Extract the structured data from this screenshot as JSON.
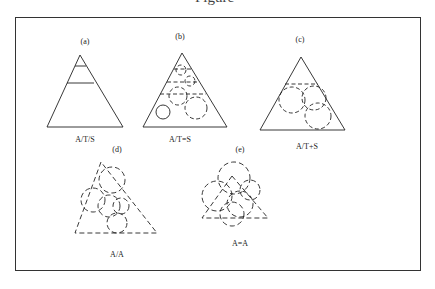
{
  "figure": {
    "title_fragment": "Figure"
  },
  "panels": [
    {
      "id": "a",
      "label": "(a)",
      "caption": "A/T/S",
      "description": "Solid triangle divided by two horizontal lines into three tiers"
    },
    {
      "id": "b",
      "label": "(b)",
      "caption": "A/T=S",
      "description": "Solid triangle with dashed tier lines and dashed circles inside"
    },
    {
      "id": "c",
      "label": "(c)",
      "caption": "A/T+S",
      "description": "Solid triangle with one dashed tier line and overlapping dashed circles extending past edge"
    },
    {
      "id": "d",
      "label": "(d)",
      "caption": "A/A",
      "description": "Dashed triangle overlapped by dashed circles"
    },
    {
      "id": "e",
      "label": "(e)",
      "caption": "A=A",
      "description": "Dashed triangle dominated by large overlapping dashed circles"
    }
  ],
  "colors": {
    "line": "#222222",
    "frame": "#333333",
    "background": "#ffffff"
  }
}
